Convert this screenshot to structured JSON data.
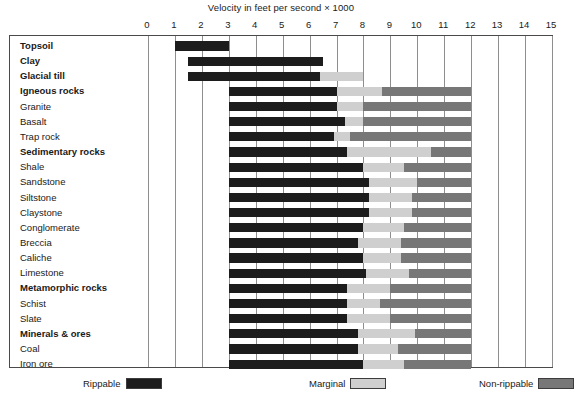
{
  "chart_data": {
    "type": "bar",
    "title": "Velocity in feet per second × 1000",
    "xlabel": "",
    "ylabel": "",
    "xlim": [
      0,
      15
    ],
    "grid": true,
    "orientation": "horizontal",
    "stacked": true,
    "legend_position": "bottom",
    "xticks": [
      "0",
      "1",
      "2",
      "3",
      "4",
      "5",
      "6",
      "7",
      "8",
      "9",
      "10",
      "11",
      "12",
      "13",
      "14",
      "15"
    ],
    "legend": [
      {
        "label": "Rippable",
        "color": "#1c1c1c"
      },
      {
        "label": "Marginal",
        "color": "#cfcfcf"
      },
      {
        "label": "Non-rippable",
        "color": "#777777"
      }
    ],
    "categories": [
      "Topsoil",
      "Clay",
      "Glacial till",
      "Igneous rocks",
      "Granite",
      "Basalt",
      "Trap rock",
      "Sedimentary rocks",
      "Shale",
      "Sandstone",
      "Siltstone",
      "Claystone",
      "Conglomerate",
      "Breccia",
      "Caliche",
      "Limestone",
      "Metamorphic rocks",
      "Schist",
      "Slate",
      "Minerals & ores",
      "Coal",
      "Iron ore"
    ],
    "rows": [
      {
        "label": "Topsoil",
        "group": true,
        "rippable": [
          1.0,
          3.0
        ],
        "marginal": null,
        "nonrippable": null
      },
      {
        "label": "Clay",
        "group": true,
        "rippable": [
          1.5,
          6.5
        ],
        "marginal": null,
        "nonrippable": null
      },
      {
        "label": "Glacial till",
        "group": true,
        "rippable": [
          1.5,
          6.4
        ],
        "marginal": [
          6.4,
          8.0
        ],
        "nonrippable": null
      },
      {
        "label": "Igneous rocks",
        "group": true,
        "rippable": [
          3.0,
          7.0
        ],
        "marginal": [
          7.0,
          8.7
        ],
        "nonrippable": [
          8.7,
          12.0
        ]
      },
      {
        "label": "Granite",
        "group": false,
        "rippable": [
          3.0,
          7.0
        ],
        "marginal": [
          7.0,
          8.0
        ],
        "nonrippable": [
          8.0,
          12.0
        ]
      },
      {
        "label": "Basalt",
        "group": false,
        "rippable": [
          3.0,
          7.3
        ],
        "marginal": [
          7.3,
          8.0
        ],
        "nonrippable": [
          8.0,
          12.0
        ]
      },
      {
        "label": "Trap rock",
        "group": false,
        "rippable": [
          3.0,
          6.9
        ],
        "marginal": [
          6.9,
          7.5
        ],
        "nonrippable": [
          7.5,
          12.0
        ]
      },
      {
        "label": "Sedimentary rocks",
        "group": true,
        "rippable": [
          3.0,
          7.4
        ],
        "marginal": [
          7.4,
          10.5
        ],
        "nonrippable": [
          10.5,
          12.0
        ]
      },
      {
        "label": "Shale",
        "group": false,
        "rippable": [
          3.0,
          8.0
        ],
        "marginal": [
          8.0,
          9.5
        ],
        "nonrippable": [
          9.5,
          12.0
        ]
      },
      {
        "label": "Sandstone",
        "group": false,
        "rippable": [
          3.0,
          8.2
        ],
        "marginal": [
          8.2,
          10.0
        ],
        "nonrippable": [
          10.0,
          12.0
        ]
      },
      {
        "label": "Siltstone",
        "group": false,
        "rippable": [
          3.0,
          8.2
        ],
        "marginal": [
          8.2,
          9.8
        ],
        "nonrippable": [
          9.8,
          12.0
        ]
      },
      {
        "label": "Claystone",
        "group": false,
        "rippable": [
          3.0,
          8.2
        ],
        "marginal": [
          8.2,
          9.8
        ],
        "nonrippable": [
          9.8,
          12.0
        ]
      },
      {
        "label": "Conglomerate",
        "group": false,
        "rippable": [
          3.0,
          8.0
        ],
        "marginal": [
          8.0,
          9.5
        ],
        "nonrippable": [
          9.5,
          12.0
        ]
      },
      {
        "label": "Breccia",
        "group": false,
        "rippable": [
          3.0,
          7.8
        ],
        "marginal": [
          7.8,
          9.4
        ],
        "nonrippable": [
          9.4,
          12.0
        ]
      },
      {
        "label": "Caliche",
        "group": false,
        "rippable": [
          3.0,
          8.0
        ],
        "marginal": [
          8.0,
          9.4
        ],
        "nonrippable": [
          9.4,
          12.0
        ]
      },
      {
        "label": "Limestone",
        "group": false,
        "rippable": [
          3.0,
          8.1
        ],
        "marginal": [
          8.1,
          9.7
        ],
        "nonrippable": [
          9.7,
          12.0
        ]
      },
      {
        "label": "Metamorphic rocks",
        "group": true,
        "rippable": [
          3.0,
          7.4
        ],
        "marginal": [
          7.4,
          9.0
        ],
        "nonrippable": [
          9.0,
          12.0
        ]
      },
      {
        "label": "Schist",
        "group": false,
        "rippable": [
          3.0,
          7.4
        ],
        "marginal": [
          7.4,
          8.6
        ],
        "nonrippable": [
          8.6,
          12.0
        ]
      },
      {
        "label": "Slate",
        "group": false,
        "rippable": [
          3.0,
          7.4
        ],
        "marginal": [
          7.4,
          9.0
        ],
        "nonrippable": [
          9.0,
          12.0
        ]
      },
      {
        "label": "Minerals & ores",
        "group": true,
        "rippable": [
          3.0,
          7.8
        ],
        "marginal": [
          7.8,
          9.9
        ],
        "nonrippable": [
          9.9,
          12.0
        ]
      },
      {
        "label": "Coal",
        "group": false,
        "rippable": [
          3.0,
          7.8
        ],
        "marginal": [
          7.8,
          9.3
        ],
        "nonrippable": [
          9.3,
          12.0
        ]
      },
      {
        "label": "Iron ore",
        "group": false,
        "rippable": [
          3.0,
          8.0
        ],
        "marginal": [
          8.0,
          9.5
        ],
        "nonrippable": [
          9.5,
          12.0
        ]
      }
    ]
  }
}
